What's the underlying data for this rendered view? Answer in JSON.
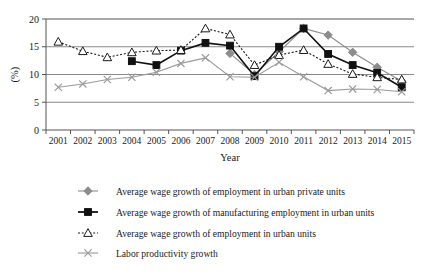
{
  "chart_data": {
    "type": "line",
    "title": "",
    "xlabel": "Year",
    "ylabel": "(%)",
    "xlim": [
      2001,
      2015
    ],
    "ylim": [
      0,
      20
    ],
    "ytick_labels": [
      "0",
      "5",
      "10",
      "15",
      "20"
    ],
    "yticks": [
      0,
      5,
      10,
      15,
      20
    ],
    "grid": "horizontal",
    "legend_position": "bottom",
    "categories": [
      "2001",
      "2002",
      "2003",
      "2004",
      "2005",
      "2006",
      "2007",
      "2008",
      "2009",
      "2010",
      "2011",
      "2012",
      "2013",
      "2014",
      "2015"
    ],
    "series": [
      {
        "name": "Average wage growth of employment in urban private units",
        "marker": "diamond",
        "color": "#8c8c8c",
        "linestyle": "solid",
        "x": [
          "2008",
          "2009",
          "2010",
          "2011",
          "2012",
          "2013",
          "2014",
          "2015"
        ],
        "values": [
          13.8,
          10.0,
          14.1,
          18.3,
          17.1,
          14.0,
          11.3,
          8.8
        ]
      },
      {
        "name": "Average wage growth of manufacturing employment in urban units",
        "marker": "square",
        "color": "#111111",
        "linestyle": "solid",
        "x": [
          "2004",
          "2005",
          "2006",
          "2007",
          "2008",
          "2009",
          "2010",
          "2011",
          "2012",
          "2013",
          "2014",
          "2015"
        ],
        "values": [
          12.4,
          11.7,
          14.3,
          15.7,
          15.2,
          9.7,
          15.0,
          18.3,
          13.7,
          11.7,
          10.3,
          7.7
        ]
      },
      {
        "name": "Average wage growth of employment in urban units",
        "marker": "triangle",
        "color": "#1a1a1a",
        "linestyle": "dotted",
        "x": [
          "2001",
          "2002",
          "2003",
          "2004",
          "2005",
          "2006",
          "2007",
          "2008",
          "2009",
          "2010",
          "2011",
          "2012",
          "2013",
          "2014",
          "2015"
        ],
        "values": [
          15.9,
          14.2,
          13.1,
          14.0,
          14.3,
          14.4,
          18.3,
          17.2,
          11.7,
          13.5,
          14.4,
          11.9,
          10.1,
          9.5,
          9.1
        ]
      },
      {
        "name": "Labor productivity growth",
        "marker": "cross",
        "color": "#9a9a9a",
        "linestyle": "solid",
        "x": [
          "2001",
          "2002",
          "2003",
          "2004",
          "2005",
          "2006",
          "2007",
          "2008",
          "2009",
          "2010",
          "2011",
          "2012",
          "2013",
          "2014",
          "2015"
        ],
        "values": [
          7.7,
          8.3,
          9.1,
          9.5,
          10.4,
          12.0,
          13.0,
          9.6,
          9.5,
          12.2,
          9.6,
          7.1,
          7.4,
          7.3,
          6.9
        ]
      }
    ]
  },
  "axis": {
    "y_label": "(%)",
    "x_label": "Year",
    "y_ticks": [
      "20",
      "15",
      "10",
      "5",
      "0"
    ],
    "x_ticks": [
      "2001",
      "2002",
      "2003",
      "2004",
      "2005",
      "2006",
      "2007",
      "2008",
      "2009",
      "2010",
      "2011",
      "2012",
      "2013",
      "2014",
      "2015"
    ]
  },
  "legend": {
    "items": [
      {
        "label": "Average wage growth of employment in urban private units",
        "marker": "diamond-marker",
        "color": "#8c8c8c",
        "dash": "none"
      },
      {
        "label": "Average wage growth of manufacturing employment in urban units",
        "marker": "square-marker",
        "color": "#111111",
        "dash": "none"
      },
      {
        "label": "Average wage growth of employment in urban units",
        "marker": "triangle-marker",
        "color": "#1a1a1a",
        "dash": "dotted"
      },
      {
        "label": "Labor productivity growth",
        "marker": "cross-marker",
        "color": "#9a9a9a",
        "dash": "none"
      }
    ]
  }
}
